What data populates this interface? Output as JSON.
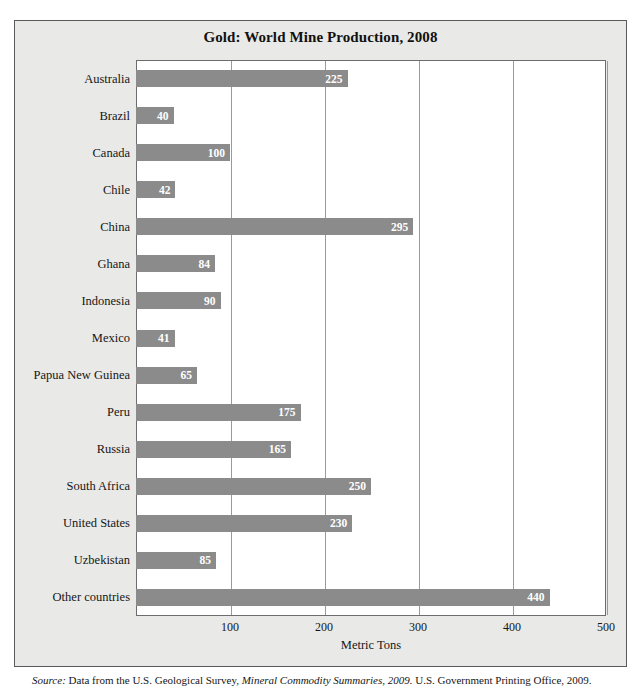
{
  "figure": {
    "title": "Gold: World Mine Production, 2008",
    "background_color": "#e9e9e7",
    "plot_background_color": "#ffffff",
    "border_color": "#5a5a5a"
  },
  "source": {
    "label": "Source:",
    "text_before_italic": " Data from the U.S. Geological Survey, ",
    "italic_title": "Mineral Commodity Summaries, 2009.",
    "text_after_italic": " U.S. Government Printing Office, 2009."
  },
  "chart_data": {
    "type": "bar",
    "orientation": "horizontal",
    "title": "Gold: World Mine Production, 2008",
    "xlabel": "Metric Tons",
    "ylabel": "",
    "xlim": [
      0,
      500
    ],
    "xticks": [
      100,
      200,
      300,
      400,
      500
    ],
    "grid": true,
    "grid_axis": "x",
    "legend": false,
    "bar_color": "#8b8b8b",
    "value_label_color": "#ffffff",
    "categories": [
      "Australia",
      "Brazil",
      "Canada",
      "Chile",
      "China",
      "Ghana",
      "Indonesia",
      "Mexico",
      "Papua New Guinea",
      "Peru",
      "Russia",
      "South Africa",
      "United States",
      "Uzbekistan",
      "Other countries"
    ],
    "values": [
      225,
      40,
      100,
      42,
      295,
      84,
      90,
      41,
      65,
      175,
      165,
      250,
      230,
      85,
      440
    ],
    "value_labels": [
      "225",
      "40",
      "100",
      "42",
      "295",
      "84",
      "90",
      "41",
      "65",
      "175",
      "165",
      "250",
      "230",
      "85",
      "440"
    ]
  }
}
